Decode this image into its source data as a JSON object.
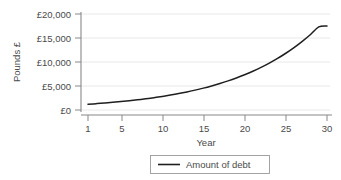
{
  "chart_data": {
    "type": "line",
    "title": "",
    "xlabel": "Year",
    "ylabel": "Pounds £",
    "xlim": [
      0,
      31
    ],
    "ylim": [
      0,
      20000
    ],
    "grid": true,
    "legend_position": "bottom",
    "x_tick_labels": [
      "1",
      "5",
      "10",
      "15",
      "20",
      "25",
      "30"
    ],
    "x_ticks": [
      1,
      5,
      10,
      15,
      20,
      25,
      30
    ],
    "y_tick_labels": [
      "£0",
      "£5,000",
      "£10,000",
      "£15,000",
      "£20,000"
    ],
    "y_ticks": [
      0,
      5000,
      10000,
      15000,
      20000
    ],
    "series": [
      {
        "name": "Amount of debt",
        "color": "#1f1f1f",
        "x": [
          1,
          2,
          3,
          4,
          5,
          6,
          7,
          8,
          9,
          10,
          11,
          12,
          13,
          14,
          15,
          16,
          17,
          18,
          19,
          20,
          21,
          22,
          23,
          24,
          25,
          26,
          27,
          28,
          29,
          30
        ],
        "values": [
          1200,
          1320,
          1452,
          1597,
          1757,
          1933,
          2126,
          2339,
          2572,
          2830,
          3113,
          3424,
          3767,
          4143,
          4558,
          5013,
          5515,
          6066,
          6673,
          7340,
          8074,
          8882,
          9770,
          10747,
          11822,
          13004,
          14304,
          15735,
          17308,
          17500
        ]
      }
    ]
  },
  "axes": {
    "y_title": "Pounds £",
    "x_title": "Year"
  },
  "legend": {
    "entries": [
      {
        "label": "Amount of debt"
      }
    ]
  }
}
